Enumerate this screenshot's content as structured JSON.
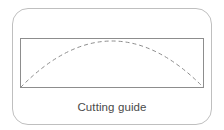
{
  "figure": {
    "caption": "Cutting guide",
    "card": {
      "shape": "rounded-rectangle",
      "border_color": "#bfbfbf",
      "fill_color": "#ffffff",
      "corner_radius_px": 16,
      "x": 12,
      "y": 8,
      "width": 200,
      "height": 117
    },
    "panel": {
      "shape": "rectangle",
      "border_color": "#8d8d8d",
      "fill_color": "#ffffff",
      "x": 20,
      "y": 38,
      "width": 184,
      "height": 50
    },
    "curve": {
      "name": "cut-line",
      "style": "dashed",
      "stroke_color": "#8d8d8d",
      "dash_pattern": "4 3",
      "start": {
        "x": 20,
        "y": 88
      },
      "peak": {
        "x": 112,
        "y": 41
      },
      "end": {
        "x": 204,
        "y": 88
      }
    }
  }
}
